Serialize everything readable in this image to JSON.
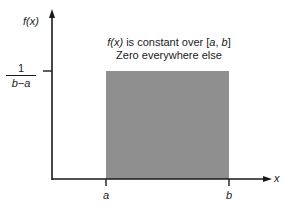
{
  "diagram": {
    "y_axis_label": "f(x)",
    "x_axis_label": "x",
    "y_tick_label": {
      "numerator": "1",
      "denominator": "b−a"
    },
    "x_tick_labels": [
      "a",
      "b"
    ],
    "annotation": {
      "line1_func": "f(x)",
      "line1_rest": " is constant over [",
      "line1_a": "a",
      "line1_sep": ", ",
      "line1_b": "b",
      "line1_end": "]",
      "line2": "Zero everywhere else"
    },
    "colors": {
      "rectangle_fill": "#8f8f8f",
      "axis": "#1a1a1a",
      "background": "#ffffff"
    }
  }
}
